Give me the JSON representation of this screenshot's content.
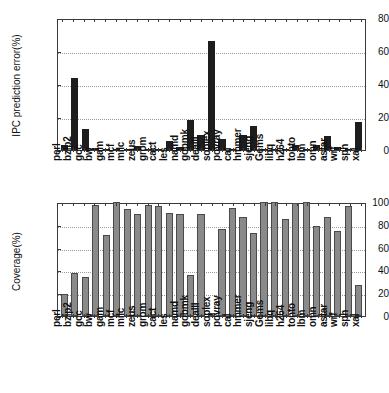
{
  "figure": {
    "title": "",
    "background": "#ffffff",
    "bar_color_top": "#1d1d1d",
    "bar_color_bottom": "#8a8a8a"
  },
  "chart_data": [
    {
      "type": "bar",
      "title": "",
      "panel": "top",
      "xlabel": "",
      "ylabel": "IPC prediction error(%)",
      "ylim": [
        0,
        80
      ],
      "yticks": [
        0,
        20,
        40,
        60,
        80
      ],
      "grid": true,
      "legend": "none",
      "categories": [
        "perl",
        "bzip2",
        "gcc",
        "bw",
        "gam",
        "mcf",
        "milc",
        "zeus",
        "grom",
        "cact",
        "les",
        "namd",
        "gobmk",
        "dealII",
        "soplex",
        "povray",
        "cal",
        "hmmer",
        "sjeng",
        "Gems",
        "libq",
        "h264",
        "tonto",
        "lbm",
        "omn",
        "astar",
        "wrf",
        "sph",
        "xal"
      ],
      "values": [
        3.0,
        43.5,
        12.6,
        1.5,
        0.3,
        0.3,
        0.7,
        2.3,
        0.5,
        0.4,
        5.7,
        1.9,
        18.2,
        9.0,
        66.0,
        6.4,
        0.4,
        9.4,
        14.5,
        0.3,
        0.3,
        0.4,
        3.0,
        0.5,
        3.1,
        8.7,
        1.6,
        0.3,
        17.0
      ]
    },
    {
      "type": "bar",
      "title": "",
      "panel": "bottom",
      "xlabel": "",
      "ylabel": "Coverage(%)",
      "ylim": [
        0,
        100
      ],
      "yticks": [
        0,
        20,
        40,
        60,
        80,
        100
      ],
      "grid": true,
      "legend": "none",
      "categories": [
        "perl",
        "bzip2",
        "gcc",
        "bw",
        "gam",
        "mcf",
        "milc",
        "zeus",
        "grom",
        "cact",
        "les",
        "namd",
        "gobmk",
        "dealII",
        "soplex",
        "povray",
        "cal",
        "hmmer",
        "sjeng",
        "Gems",
        "libq",
        "h264",
        "tonto",
        "lbm",
        "omn",
        "astar",
        "wrf",
        "sph",
        "xal"
      ],
      "values": [
        19.3,
        38.0,
        33.8,
        97.8,
        71.2,
        100.0,
        94.0,
        89.2,
        97.0,
        96.2,
        90.5,
        89.3,
        36.3,
        89.2,
        3.0,
        76.0,
        95.0,
        86.5,
        73.2,
        100.0,
        100.0,
        84.8,
        98.7,
        100.0,
        78.7,
        86.7,
        75.0,
        96.3,
        27.2
      ]
    }
  ]
}
